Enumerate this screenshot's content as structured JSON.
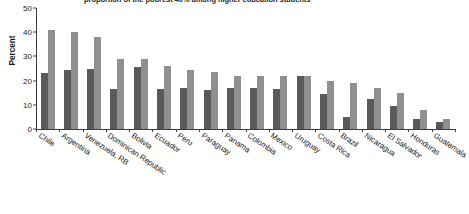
{
  "chart_data": {
    "type": "bar",
    "title": "proportion of the poorest 40% among higher education students",
    "xlabel": "",
    "ylabel": "Percent",
    "ylim": [
      0,
      50
    ],
    "yticks": [
      0,
      10,
      20,
      30,
      40,
      50
    ],
    "grid": false,
    "legend": "none",
    "categories": [
      "Chile",
      "Argentina",
      "Venezuela, RB",
      "Dominican Republic",
      "Bolivia",
      "Ecuador",
      "Peru",
      "Paraguay",
      "Panama",
      "Colombia",
      "Mexico",
      "Uruguay",
      "Costa Rica",
      "Brazil",
      "Nicaragua",
      "El Salvador",
      "Honduras",
      "Guatemala"
    ],
    "series": [
      {
        "name": "dark",
        "color": "#5a5a5a",
        "values": [
          23,
          24.5,
          25,
          16.5,
          25.5,
          16.5,
          17,
          16,
          17,
          17,
          16.5,
          22,
          14.5,
          5,
          12.5,
          9.5,
          4,
          3
        ]
      },
      {
        "name": "light",
        "color": "#909090",
        "values": [
          41,
          40,
          38,
          29,
          28.8,
          26,
          24.5,
          23.5,
          22,
          22,
          22,
          21.8,
          20,
          19,
          17,
          15,
          8,
          4
        ]
      }
    ]
  }
}
